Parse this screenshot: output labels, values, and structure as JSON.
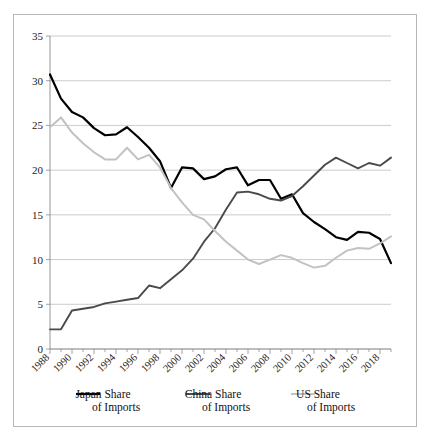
{
  "chart_data": {
    "type": "line",
    "title": "",
    "xlabel": "",
    "ylabel": "",
    "ylim": [
      0,
      35
    ],
    "yticks": [
      0,
      5,
      10,
      15,
      20,
      25,
      30,
      35
    ],
    "xlim": [
      1988,
      2019
    ],
    "xticks": [
      1988,
      1990,
      1992,
      1994,
      1996,
      1998,
      2000,
      2002,
      2004,
      2006,
      2008,
      2010,
      2012,
      2014,
      2016,
      2018
    ],
    "xtick_labels": [
      "1988",
      "1990",
      "1992",
      "1994",
      "1996",
      "1998",
      "2000",
      "2002",
      "2004",
      "2006",
      "2008",
      "2010",
      "2012",
      "2014",
      "2016",
      "2018"
    ],
    "grid": true,
    "legend_position": "bottom",
    "x": [
      1988,
      1989,
      1990,
      1991,
      1992,
      1993,
      1994,
      1995,
      1996,
      1997,
      1998,
      1999,
      2000,
      2001,
      2002,
      2003,
      2004,
      2005,
      2006,
      2007,
      2008,
      2009,
      2010,
      2011,
      2012,
      2013,
      2014,
      2015,
      2016,
      2017,
      2018,
      2019
    ],
    "series": [
      {
        "name": "Japan Share of Imports",
        "color": "#000000",
        "width": 2.2,
        "values": [
          30.7,
          28.0,
          26.5,
          25.9,
          24.7,
          23.9,
          24.0,
          24.8,
          23.7,
          22.5,
          21.0,
          18.0,
          20.3,
          20.2,
          19.0,
          19.3,
          20.1,
          20.3,
          18.3,
          18.9,
          18.9,
          16.8,
          17.3,
          15.2,
          14.2,
          13.4,
          12.5,
          12.2,
          13.1,
          13.0,
          12.3,
          9.6
        ]
      },
      {
        "name": "China Share of Imports",
        "color": "#4a4a4a",
        "width": 1.9,
        "values": [
          2.2,
          2.2,
          4.3,
          4.5,
          4.7,
          5.1,
          5.3,
          5.5,
          5.7,
          7.1,
          6.8,
          7.8,
          8.8,
          10.1,
          12.0,
          13.5,
          15.6,
          17.5,
          17.6,
          17.3,
          16.8,
          16.6,
          17.1,
          18.2,
          19.4,
          20.6,
          21.4,
          20.8,
          20.2,
          20.8,
          20.5,
          21.4
        ]
      },
      {
        "name": "US Share of Imports",
        "color": "#c2c2c2",
        "width": 2.0,
        "values": [
          24.8,
          25.9,
          24.2,
          23.0,
          22.0,
          21.2,
          21.2,
          22.5,
          21.2,
          21.7,
          20.3,
          18.0,
          16.4,
          15.0,
          14.5,
          13.2,
          12.0,
          11.0,
          10.0,
          9.5,
          10.0,
          10.5,
          10.2,
          9.6,
          9.1,
          9.3,
          10.2,
          11.0,
          11.3,
          11.2,
          11.8,
          12.6
        ]
      }
    ]
  },
  "legend": {
    "items": [
      {
        "label_line1": "Japan Share",
        "label_line2": "of Imports",
        "color": "#000000",
        "width": 2.2
      },
      {
        "label_line1": "China Share",
        "label_line2": "of Imports",
        "color": "#4a4a4a",
        "width": 2.0
      },
      {
        "label_line1": "US Share",
        "label_line2": "of Imports",
        "color": "#c2c2c2",
        "width": 2.0
      }
    ]
  }
}
